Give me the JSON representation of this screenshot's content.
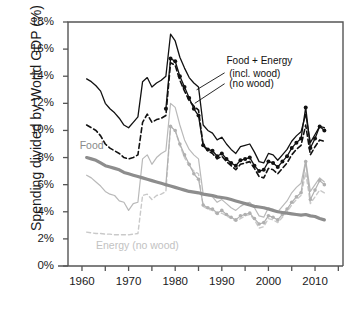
{
  "chart_data": {
    "type": "line",
    "title": "",
    "xlabel": "",
    "ylabel": "Spending divided by World GDP (%)",
    "xlim": [
      1957,
      2016
    ],
    "ylim": [
      0,
      18
    ],
    "ytick_values": [
      0,
      2,
      4,
      6,
      8,
      10,
      12,
      14,
      16,
      18
    ],
    "ytick_labels": [
      "0%",
      "2%",
      "4%",
      "6%",
      "8%",
      "10%",
      "12%",
      "14%",
      "16%",
      "18%"
    ],
    "xtick_values": [
      1960,
      1965,
      1970,
      1975,
      1980,
      1985,
      1990,
      1995,
      2000,
      2005,
      2010,
      2015
    ],
    "xtick_labels": [
      "1960",
      "",
      "1970",
      "",
      "1980",
      "",
      "1990",
      "",
      "2000",
      "",
      "2010",
      ""
    ],
    "grid": false,
    "legend_position": "inline-annotations",
    "annotations": [
      {
        "id": "food-energy-title",
        "text": "Food + Energy",
        "x": 1991.0,
        "y": 15.1,
        "color": "#111111"
      },
      {
        "id": "food-energy-incl-wood",
        "text": "(incl. wood)",
        "x": 1991.6,
        "y": 14.2,
        "color": "#111111"
      },
      {
        "id": "food-energy-no-wood",
        "text": "(no wood)",
        "x": 1991.6,
        "y": 13.4,
        "color": "#111111"
      },
      {
        "id": "food-label",
        "text": "Food",
        "x": 1959.5,
        "y": 8.9,
        "color": "#8a8a8a"
      },
      {
        "id": "energy-no-wood-label",
        "text": "Energy (no wood)",
        "x": 1963.0,
        "y": 1.55,
        "color": "#c2c2c2"
      }
    ],
    "colors": {
      "food_energy_incl_wood": "#111111",
      "food_energy_no_wood": "#111111",
      "food_energy_markers": "#111111",
      "food": "#8d8d8d",
      "energy_incl_wood": "#b9b9b9",
      "energy_no_wood": "#c9c9c9",
      "energy_markers": "#b0b0b0",
      "axis": "#555555",
      "background": "#ffffff"
    },
    "series": [
      {
        "name": "Food + Energy (incl. wood)",
        "style": "solid",
        "color": "#111111",
        "width": 1.3,
        "markers": false,
        "x": [
          1961,
          1962,
          1963,
          1964,
          1965,
          1966,
          1967,
          1968,
          1969,
          1970,
          1971,
          1972,
          1973,
          1974,
          1975,
          1976,
          1977,
          1978,
          1979,
          1980,
          1981,
          1982,
          1983,
          1984,
          1985,
          1986,
          1987,
          1988,
          1989,
          1990,
          1991,
          1992,
          1993,
          1994,
          1995,
          1996,
          1997,
          1998,
          1999,
          2000,
          2001,
          2002,
          2003,
          2004,
          2005,
          2006,
          2007,
          2008,
          2009,
          2010,
          2011,
          2012
        ],
        "values": [
          13.8,
          13.6,
          13.3,
          12.9,
          12.0,
          11.6,
          11.3,
          10.9,
          10.4,
          10.2,
          10.6,
          11.0,
          13.6,
          13.9,
          13.2,
          13.5,
          13.7,
          14.0,
          17.1,
          16.6,
          15.4,
          14.6,
          13.9,
          13.5,
          13.2,
          10.4,
          10.0,
          9.8,
          9.3,
          9.5,
          9.0,
          8.6,
          8.3,
          8.8,
          8.9,
          9.0,
          8.4,
          7.7,
          7.6,
          8.3,
          8.2,
          7.8,
          8.2,
          8.6,
          9.2,
          9.6,
          9.9,
          11.2,
          9.1,
          9.7,
          10.3,
          10.2
        ]
      },
      {
        "name": "Food + Energy (no wood)",
        "style": "dashed",
        "color": "#111111",
        "width": 1.6,
        "markers": false,
        "x": [
          1961,
          1962,
          1963,
          1964,
          1965,
          1966,
          1967,
          1968,
          1969,
          1970,
          1971,
          1972,
          1973,
          1974,
          1975,
          1976,
          1977,
          1978,
          1979,
          1980,
          1981,
          1982,
          1983,
          1984,
          1985,
          1986,
          1987,
          1988,
          1989,
          1990,
          1991,
          1992,
          1993,
          1994,
          1995,
          1996,
          1997,
          1998,
          1999,
          2000,
          2001,
          2002,
          2003,
          2004,
          2005,
          2006,
          2007,
          2008,
          2009,
          2010,
          2011,
          2012
        ],
        "values": [
          10.4,
          10.2,
          10.0,
          9.6,
          9.0,
          8.7,
          8.5,
          8.3,
          8.0,
          7.9,
          8.0,
          8.2,
          10.6,
          11.2,
          10.6,
          10.8,
          10.9,
          11.1,
          15.0,
          14.8,
          13.7,
          12.9,
          12.2,
          11.8,
          11.5,
          8.9,
          8.5,
          8.3,
          7.9,
          8.1,
          7.7,
          7.4,
          7.1,
          7.5,
          7.6,
          7.7,
          7.2,
          6.6,
          6.5,
          7.2,
          7.1,
          6.8,
          7.2,
          7.6,
          8.2,
          8.6,
          8.9,
          10.4,
          8.2,
          8.8,
          9.3,
          9.2
        ]
      },
      {
        "name": "Food + Energy (markers)",
        "style": "solid-markers",
        "color": "#111111",
        "width": 1.3,
        "markers": true,
        "x": [
          1978,
          1979,
          1980,
          1981,
          1982,
          1983,
          1984,
          1985,
          1986,
          1987,
          1988,
          1989,
          1990,
          1991,
          1992,
          1993,
          1994,
          1995,
          1996,
          1997,
          1998,
          1999,
          2000,
          2001,
          2002,
          2003,
          2004,
          2005,
          2006,
          2007,
          2008,
          2009,
          2010,
          2011,
          2012
        ],
        "values": [
          11.6,
          15.3,
          15.1,
          14.0,
          13.2,
          12.4,
          11.6,
          11.1,
          8.9,
          8.6,
          8.5,
          8.1,
          8.3,
          7.9,
          7.6,
          7.4,
          7.8,
          7.9,
          8.0,
          7.4,
          7.0,
          7.1,
          7.7,
          7.6,
          7.3,
          7.7,
          8.1,
          8.7,
          9.1,
          9.4,
          11.7,
          8.7,
          9.4,
          10.3,
          10.0
        ]
      },
      {
        "name": "Food",
        "style": "solid-thick",
        "color": "#8d8d8d",
        "width": 3.2,
        "markers": false,
        "x": [
          1961,
          1962,
          1963,
          1964,
          1965,
          1966,
          1967,
          1968,
          1969,
          1970,
          1971,
          1972,
          1973,
          1974,
          1975,
          1976,
          1977,
          1978,
          1979,
          1980,
          1981,
          1982,
          1983,
          1984,
          1985,
          1986,
          1987,
          1988,
          1989,
          1990,
          1991,
          1992,
          1993,
          1994,
          1995,
          1996,
          1997,
          1998,
          1999,
          2000,
          2001,
          2002,
          2003,
          2004,
          2005,
          2006,
          2007,
          2008,
          2009,
          2010,
          2011,
          2012
        ],
        "values": [
          8.0,
          7.9,
          7.8,
          7.6,
          7.4,
          7.3,
          7.2,
          7.1,
          6.9,
          6.8,
          6.7,
          6.6,
          6.5,
          6.4,
          6.3,
          6.2,
          6.1,
          6.0,
          5.9,
          5.8,
          5.7,
          5.6,
          5.5,
          5.45,
          5.4,
          5.3,
          5.25,
          5.2,
          5.1,
          5.05,
          5.0,
          4.9,
          4.8,
          4.7,
          4.6,
          4.5,
          4.4,
          4.35,
          4.3,
          4.2,
          4.1,
          4.0,
          3.95,
          3.9,
          3.85,
          3.8,
          3.75,
          3.8,
          3.7,
          3.65,
          3.5,
          3.4
        ]
      },
      {
        "name": "Energy (incl. wood)",
        "style": "solid-thin",
        "color": "#b9b9b9",
        "width": 1.2,
        "markers": false,
        "x": [
          1961,
          1962,
          1963,
          1964,
          1965,
          1966,
          1967,
          1968,
          1969,
          1970,
          1971,
          1972,
          1973,
          1974,
          1975,
          1976,
          1977,
          1978,
          1979,
          1980,
          1981,
          1982,
          1983,
          1984,
          1985,
          1986,
          1987,
          1988,
          1989,
          1990,
          1991,
          1992,
          1993,
          1994,
          1995,
          1996,
          1997,
          1998,
          1999,
          2000,
          2001,
          2002,
          2003,
          2004,
          2005,
          2006,
          2007,
          2008,
          2009,
          2010,
          2011,
          2012
        ],
        "values": [
          6.7,
          6.5,
          6.2,
          5.9,
          5.5,
          5.3,
          5.2,
          4.8,
          4.7,
          4.1,
          4.6,
          4.7,
          7.9,
          8.2,
          7.5,
          8.0,
          8.3,
          8.5,
          12.0,
          11.7,
          10.4,
          9.3,
          8.6,
          8.2,
          7.9,
          5.3,
          5.2,
          5.1,
          4.7,
          4.9,
          4.6,
          4.3,
          4.1,
          4.4,
          4.6,
          4.7,
          4.3,
          3.7,
          3.6,
          4.3,
          4.2,
          4.0,
          4.4,
          4.8,
          5.4,
          5.8,
          6.1,
          7.8,
          5.5,
          6.0,
          6.5,
          6.2
        ]
      },
      {
        "name": "Energy (no wood)",
        "style": "dashed-thin",
        "color": "#c9c9c9",
        "width": 1.4,
        "markers": false,
        "x": [
          1961,
          1962,
          1963,
          1964,
          1965,
          1966,
          1967,
          1968,
          1969,
          1970,
          1971,
          1972,
          1973,
          1974,
          1975,
          1976,
          1977,
          1978,
          1979,
          1980,
          1981,
          1982,
          1983,
          1984,
          1985,
          1986,
          1987,
          1988,
          1989,
          1990,
          1991,
          1992,
          1993,
          1994,
          1995,
          1996,
          1997,
          1998,
          1999,
          2000,
          2001,
          2002,
          2003,
          2004,
          2005,
          2006,
          2007,
          2008,
          2009,
          2010,
          2011,
          2012
        ],
        "values": [
          2.5,
          2.45,
          2.4,
          2.4,
          2.35,
          2.35,
          2.3,
          2.3,
          2.3,
          2.3,
          2.35,
          2.4,
          5.2,
          5.3,
          4.9,
          5.2,
          5.3,
          5.5,
          10.3,
          10.0,
          8.9,
          8.0,
          7.4,
          7.0,
          6.8,
          4.4,
          4.2,
          4.1,
          3.8,
          3.9,
          3.7,
          3.5,
          3.3,
          3.5,
          3.7,
          3.8,
          3.4,
          2.8,
          2.9,
          3.5,
          3.4,
          3.2,
          3.6,
          4.0,
          4.5,
          4.9,
          5.2,
          6.9,
          4.6,
          5.1,
          5.6,
          5.4
        ]
      },
      {
        "name": "Energy (markers)",
        "style": "solid-markers-gray",
        "color": "#b0b0b0",
        "width": 1.2,
        "markers": true,
        "x": [
          1978,
          1979,
          1980,
          1981,
          1982,
          1983,
          1984,
          1985,
          1986,
          1987,
          1988,
          1989,
          1990,
          1991,
          1992,
          1993,
          1994,
          1995,
          1996,
          1997,
          1998,
          1999,
          2000,
          2001,
          2002,
          2003,
          2004,
          2005,
          2006,
          2007,
          2008,
          2009,
          2010,
          2011,
          2012
        ],
        "values": [
          6.0,
          10.3,
          10.0,
          9.0,
          8.2,
          7.5,
          6.8,
          6.4,
          4.5,
          4.3,
          4.2,
          3.9,
          4.1,
          3.8,
          3.6,
          3.4,
          3.7,
          3.8,
          3.9,
          3.5,
          3.1,
          3.2,
          3.7,
          3.6,
          3.4,
          3.8,
          4.2,
          4.7,
          5.1,
          5.4,
          7.7,
          4.9,
          5.6,
          6.3,
          6.0
        ]
      }
    ]
  }
}
